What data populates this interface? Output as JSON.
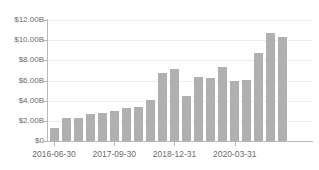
{
  "chart_data": {
    "type": "bar",
    "title": "",
    "subtitle": "",
    "xlabel": "",
    "ylabel": "",
    "ylim": [
      0,
      12000000000
    ],
    "grid": true,
    "legend": "none",
    "bar_color": "#b0b0b0",
    "grid_color": "#ececec",
    "axis_color": "#b9b9b9",
    "tick_label_color": "#6b6b6b",
    "y_ticks": [
      {
        "value": 0,
        "label": "$0"
      },
      {
        "value": 2000000000,
        "label": "$2.00B"
      },
      {
        "value": 4000000000,
        "label": "$4.00B"
      },
      {
        "value": 6000000000,
        "label": "$6.00B"
      },
      {
        "value": 8000000000,
        "label": "$8.00B"
      },
      {
        "value": 10000000000,
        "label": "$10.00B"
      },
      {
        "value": 12000000000,
        "label": "$12.00B"
      }
    ],
    "x_ticks": [
      {
        "index": 0,
        "label": "2016-06-30"
      },
      {
        "index": 5,
        "label": "2017-09-30"
      },
      {
        "index": 10,
        "label": "2018-12-31"
      },
      {
        "index": 15,
        "label": "2020-03-31"
      }
    ],
    "categories": [
      "2016-06-30",
      "2016-09-30",
      "2016-12-31",
      "2017-03-31",
      "2017-06-30",
      "2017-09-30",
      "2017-12-31",
      "2018-03-31",
      "2018-06-30",
      "2018-09-30",
      "2018-12-31",
      "2019-03-31",
      "2019-06-30",
      "2019-09-30",
      "2019-12-31",
      "2020-03-31",
      "2020-06-30",
      "2020-09-30",
      "2020-12-31",
      "2021-03-31",
      "2021-06-30",
      "2021-09-30"
    ],
    "values": [
      1250000000,
      2300000000,
      2280000000,
      2700000000,
      2820000000,
      2990000000,
      3280000000,
      3420000000,
      4020000000,
      6780000000,
      7180000000,
      4500000000,
      6330000000,
      6250000000,
      7330000000,
      5950000000,
      6020000000,
      8730000000,
      10700000000,
      10300000000,
      0,
      0
    ],
    "value_labels": [
      "$1.25B",
      "$2.30B",
      "$2.28B",
      "$2.70B",
      "$2.82B",
      "$2.99B",
      "$3.28B",
      "$3.42B",
      "$4.02B",
      "$6.78B",
      "$7.18B",
      "$4.50B",
      "$6.33B",
      "$6.25B",
      "$7.33B",
      "$5.95B",
      "$6.02B",
      "$8.73B",
      "$10.70B",
      "$10.30B",
      "",
      ""
    ]
  }
}
